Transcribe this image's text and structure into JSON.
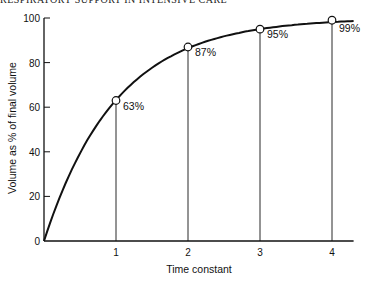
{
  "page": {
    "running_head": "RESPIRATORY SUPPORT IN INTENSIVE CARE"
  },
  "chart_data": {
    "type": "line",
    "title": "",
    "xlabel": "Time constant",
    "ylabel": "Volume as % of final volume",
    "xlim": [
      0,
      4.3
    ],
    "ylim": [
      0,
      100
    ],
    "x_ticks": [
      "1",
      "2",
      "3",
      "4"
    ],
    "y_ticks": [
      "0",
      "20",
      "40",
      "60",
      "80",
      "100"
    ],
    "grid": false,
    "legend": null,
    "series": [
      {
        "name": "Exponential filling curve",
        "x": [
          0,
          0.25,
          0.5,
          0.75,
          1,
          1.5,
          2,
          2.5,
          3,
          3.5,
          4,
          4.3
        ],
        "y": [
          0,
          22,
          39,
          53,
          63,
          78,
          87,
          92,
          95,
          97,
          99,
          99.3
        ]
      }
    ],
    "marked_points": [
      {
        "x": 1,
        "y": 63,
        "label": "63%"
      },
      {
        "x": 2,
        "y": 87,
        "label": "87%"
      },
      {
        "x": 3,
        "y": 95,
        "label": "95%"
      },
      {
        "x": 4,
        "y": 99,
        "label": "99%"
      }
    ],
    "annotations": [
      "Vertical drop lines from each marked point to the x-axis"
    ]
  },
  "colors": {
    "line": "#111111",
    "background": "#ffffff"
  }
}
